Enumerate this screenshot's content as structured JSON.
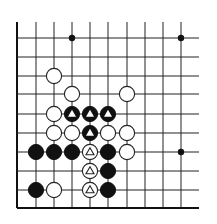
{
  "diagram": {
    "type": "go-board-corner",
    "visible_columns": 10,
    "visible_rows": 10,
    "edges": [
      "left",
      "bottom"
    ],
    "colors": {
      "black": "#111111",
      "white": "#ffffff",
      "line": "#222222",
      "background": "#ffffff"
    },
    "grid": {
      "x": [
        17,
        36,
        54,
        72,
        90,
        108,
        127,
        145,
        163,
        181
      ],
      "y": [
        38,
        57,
        76,
        94,
        114,
        133,
        152,
        171,
        190,
        208
      ],
      "top_open_y": 22,
      "right_open_x": 199
    },
    "star_points": [
      {
        "col": 3,
        "row": 0
      },
      {
        "col": 9,
        "row": 0
      },
      {
        "col": 9,
        "row": 6
      }
    ],
    "stones": [
      {
        "color": "white",
        "col": 2,
        "row": 2,
        "mark": ""
      },
      {
        "color": "white",
        "col": 3,
        "row": 3,
        "mark": ""
      },
      {
        "color": "white",
        "col": 6,
        "row": 3,
        "mark": ""
      },
      {
        "color": "white",
        "col": 2,
        "row": 4,
        "mark": ""
      },
      {
        "color": "black",
        "col": 3,
        "row": 4,
        "mark": "triangle"
      },
      {
        "color": "black",
        "col": 4,
        "row": 4,
        "mark": "triangle"
      },
      {
        "color": "black",
        "col": 5,
        "row": 4,
        "mark": "triangle"
      },
      {
        "color": "white",
        "col": 2,
        "row": 5,
        "mark": ""
      },
      {
        "color": "white",
        "col": 3,
        "row": 5,
        "mark": ""
      },
      {
        "color": "black",
        "col": 4,
        "row": 5,
        "mark": "triangle"
      },
      {
        "color": "white",
        "col": 5,
        "row": 5,
        "mark": ""
      },
      {
        "color": "white",
        "col": 6,
        "row": 5,
        "mark": ""
      },
      {
        "color": "black",
        "col": 1,
        "row": 6,
        "mark": ""
      },
      {
        "color": "black",
        "col": 2,
        "row": 6,
        "mark": ""
      },
      {
        "color": "black",
        "col": 3,
        "row": 6,
        "mark": ""
      },
      {
        "color": "white",
        "col": 4,
        "row": 6,
        "mark": "triangle"
      },
      {
        "color": "black",
        "col": 5,
        "row": 6,
        "mark": ""
      },
      {
        "color": "white",
        "col": 6,
        "row": 6,
        "mark": ""
      },
      {
        "color": "white",
        "col": 4,
        "row": 7,
        "mark": "triangle"
      },
      {
        "color": "black",
        "col": 5,
        "row": 7,
        "mark": ""
      },
      {
        "color": "black",
        "col": 1,
        "row": 8,
        "mark": ""
      },
      {
        "color": "white",
        "col": 2,
        "row": 8,
        "mark": ""
      },
      {
        "color": "white",
        "col": 4,
        "row": 8,
        "mark": "triangle"
      },
      {
        "color": "black",
        "col": 5,
        "row": 8,
        "mark": ""
      }
    ]
  }
}
